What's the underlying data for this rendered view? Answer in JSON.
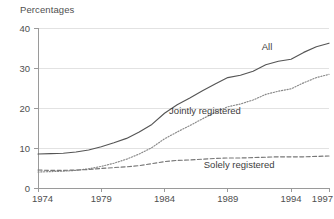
{
  "chart_data": {
    "type": "line",
    "title": "Percentages",
    "xlabel": "",
    "ylabel": "Percentages",
    "xlim": [
      1974,
      1997
    ],
    "ylim": [
      0,
      40
    ],
    "yticks": [
      0,
      10,
      20,
      30,
      40
    ],
    "ytick_labels": [
      "0",
      "10",
      "20",
      "30",
      "40"
    ],
    "xticks": [
      1974,
      1979,
      1984,
      1989,
      1994,
      1997
    ],
    "xtick_labels": [
      "1974",
      "1979",
      "1984",
      "1989",
      "1994",
      "1997"
    ],
    "grid": "horizontal",
    "legend_position": "inline-annotations",
    "series": [
      {
        "name": "All",
        "style": "solid",
        "color": "#555555",
        "label": "All",
        "x": [
          1974,
          1975,
          1976,
          1977,
          1978,
          1979,
          1980,
          1981,
          1982,
          1983,
          1984,
          1985,
          1986,
          1987,
          1988,
          1989,
          1990,
          1991,
          1992,
          1993,
          1994,
          1995,
          1996,
          1997
        ],
        "values": [
          8.5,
          8.6,
          8.7,
          9.0,
          9.5,
          10.3,
          11.3,
          12.4,
          14.0,
          15.9,
          18.7,
          20.8,
          22.5,
          24.3,
          26.0,
          27.6,
          28.2,
          29.2,
          30.8,
          31.7,
          32.2,
          33.9,
          35.3,
          36.2
        ]
      },
      {
        "name": "Jointly registered",
        "style": "dotted",
        "color": "#888888",
        "label": "Jointly registered",
        "x": [
          1974,
          1975,
          1976,
          1977,
          1978,
          1979,
          1980,
          1981,
          1982,
          1983,
          1984,
          1985,
          1986,
          1987,
          1988,
          1989,
          1990,
          1991,
          1992,
          1993,
          1994,
          1995,
          1996,
          1997
        ],
        "values": [
          4.0,
          4.1,
          4.2,
          4.4,
          4.8,
          5.4,
          6.2,
          7.2,
          8.5,
          10.1,
          12.3,
          14.0,
          15.6,
          17.3,
          18.9,
          20.3,
          21.0,
          22.0,
          23.4,
          24.2,
          24.8,
          26.3,
          27.6,
          28.4
        ]
      },
      {
        "name": "Solely registered",
        "style": "dashed",
        "color": "#777777",
        "label": "Solely registered",
        "x": [
          1974,
          1975,
          1976,
          1977,
          1978,
          1979,
          1980,
          1981,
          1982,
          1983,
          1984,
          1985,
          1986,
          1987,
          1988,
          1989,
          1990,
          1991,
          1992,
          1993,
          1994,
          1995,
          1996,
          1997
        ],
        "values": [
          4.5,
          4.4,
          4.4,
          4.5,
          4.6,
          4.9,
          5.1,
          5.3,
          5.6,
          6.1,
          6.6,
          6.9,
          7.0,
          7.2,
          7.4,
          7.5,
          7.5,
          7.6,
          7.7,
          7.8,
          7.8,
          7.8,
          7.9,
          8.0
        ]
      }
    ],
    "annotations": [
      {
        "text": "All",
        "x": 1992.1,
        "y": 34.6
      },
      {
        "text": "Jointly registered",
        "x": 1987.2,
        "y": 18.6
      },
      {
        "text": "Solely registered",
        "x": 1989.9,
        "y": 5.0
      }
    ]
  },
  "footnote": {
    "text": ""
  }
}
